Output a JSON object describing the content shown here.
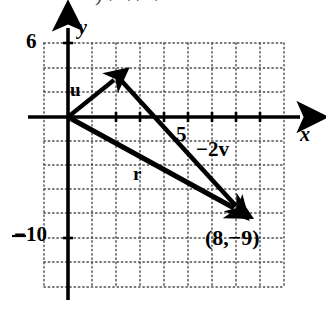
{
  "figure": {
    "kind": "vector-diagram",
    "width": 326,
    "height": 319,
    "background_color": "#ffffff",
    "ink_color": "#000000",
    "grid_color": "#4d4d4d",
    "top_cut_text": ")   /   \\   /   \\"
  },
  "axes": {
    "x_label": "x",
    "y_label": "y",
    "origin_px": [
      68,
      117
    ],
    "px_per_unit": 12.1,
    "units_per_grid_cell": 2,
    "x_range": [
      -2,
      16
    ],
    "y_range": [
      -14,
      8
    ],
    "grid": "dotted"
  },
  "tick_labels": [
    {
      "text": "6",
      "axis": "y",
      "value": 6,
      "x": 26,
      "y": 31
    },
    {
      "text": "−10",
      "axis": "y",
      "value": -10,
      "x": 14,
      "y": 224
    },
    {
      "text": "5",
      "axis": "x",
      "value": 5,
      "x": 176,
      "y": 124
    }
  ],
  "vectors": [
    {
      "name": "u",
      "label": "u",
      "from_px": [
        68,
        117
      ],
      "to_px": [
        118,
        77
      ],
      "label_px": [
        70,
        80
      ],
      "head": "arrow"
    },
    {
      "name": "minus-2v",
      "label": "−2v",
      "from_px": [
        118,
        77
      ],
      "to_px": [
        241,
        212
      ],
      "label_px": [
        196,
        139
      ],
      "head": "arrow"
    },
    {
      "name": "r",
      "label": "r",
      "from_px": [
        68,
        117
      ],
      "to_px": [
        241,
        212
      ],
      "label_px": [
        133,
        164
      ],
      "head": "arrow"
    }
  ],
  "point_labels": [
    {
      "text": "(8,−9)",
      "at_px": [
        205,
        227
      ],
      "refers_to_px": [
        241,
        212
      ]
    }
  ]
}
